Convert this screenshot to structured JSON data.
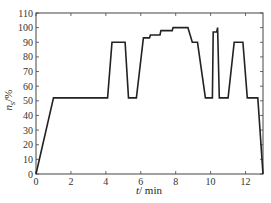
{
  "chart_data": {
    "type": "line",
    "title": "",
    "xlabel": "t / min",
    "ylabel": "n_s / %",
    "xlim": [
      0,
      13
    ],
    "ylim": [
      0,
      110
    ],
    "x_ticks": [
      0,
      2,
      4,
      6,
      8,
      10,
      12
    ],
    "y_ticks": [
      0,
      10,
      20,
      30,
      40,
      50,
      60,
      70,
      80,
      90,
      100,
      110
    ],
    "grid": false,
    "legend": null,
    "series": [
      {
        "name": "n_s",
        "color": "#222222",
        "x": [
          0,
          1.0,
          4.1,
          4.35,
          5.1,
          5.3,
          5.75,
          6.15,
          6.5,
          6.55,
          7.1,
          7.15,
          7.8,
          7.85,
          8.7,
          8.95,
          9.25,
          9.7,
          10.1,
          10.15,
          10.35,
          10.4,
          10.5,
          11.0,
          11.35,
          11.85,
          12.1,
          12.5,
          12.7,
          13.0
        ],
        "y": [
          0,
          52,
          52,
          90,
          90,
          52,
          52,
          93,
          93,
          95,
          95,
          98,
          98,
          100,
          100,
          90,
          90,
          52,
          52,
          97,
          97,
          100,
          52,
          52,
          90,
          90,
          52,
          52,
          52,
          0
        ]
      }
    ]
  },
  "labels": {
    "xlabel_italic": "t",
    "xlabel_unit": "/ min",
    "ylabel_italic": "n",
    "ylabel_sub": "s",
    "ylabel_unit": "/%",
    "x_tick_labels": [
      "0",
      "2",
      "4",
      "6",
      "8",
      "10",
      "12"
    ],
    "y_tick_labels": [
      "0",
      "10",
      "20",
      "30",
      "40",
      "50",
      "60",
      "70",
      "80",
      "90",
      "100",
      "110"
    ]
  }
}
